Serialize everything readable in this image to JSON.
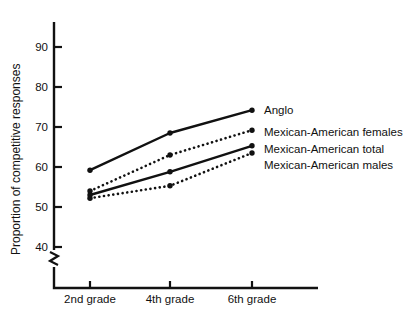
{
  "chart_data": {
    "type": "line",
    "title": "",
    "xlabel": "",
    "ylabel": "Proportion of competitive responses",
    "categories": [
      "2nd grade",
      "4th grade",
      "6th grade"
    ],
    "yticks": [
      40,
      50,
      60,
      70,
      80,
      90
    ],
    "ylim": [
      38,
      96
    ],
    "y_axis_break": true,
    "grid": false,
    "legend_position": "right-inline-endpoint",
    "series": [
      {
        "name": "Anglo",
        "style": "solid",
        "marker": "filled-circle",
        "values": [
          59.2,
          68.5,
          74.2
        ]
      },
      {
        "name": "Mexican-American females",
        "style": "dotted",
        "marker": "filled-circle",
        "values": [
          54.0,
          63.0,
          69.2
        ]
      },
      {
        "name": "Mexican-American total",
        "style": "solid",
        "marker": "filled-circle",
        "values": [
          53.0,
          58.8,
          65.3
        ]
      },
      {
        "name": "Mexican-American males",
        "style": "dotted",
        "marker": "filled-circle",
        "values": [
          52.2,
          55.3,
          63.5
        ]
      }
    ]
  },
  "axis": {
    "y_title": "Proportion of competitive responses",
    "tick_40": "40",
    "tick_50": "50",
    "tick_60": "60",
    "tick_70": "70",
    "tick_80": "80",
    "tick_90": "90"
  },
  "categories": {
    "c0": "2nd grade",
    "c1": "4th grade",
    "c2": "6th grade"
  },
  "legend": {
    "s0": "Anglo",
    "s1": "Mexican-American females",
    "s2": "Mexican-American total",
    "s3": "Mexican-American males"
  },
  "colors": {
    "ink": "#111111",
    "background": "#ffffff"
  }
}
